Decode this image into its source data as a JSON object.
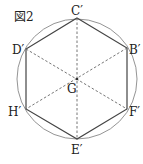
{
  "figure": {
    "title": "図2",
    "center_label": "G",
    "vertices": [
      {
        "id": "C",
        "label": "C′"
      },
      {
        "id": "B",
        "label": "B′"
      },
      {
        "id": "F",
        "label": "F′"
      },
      {
        "id": "E",
        "label": "E′"
      },
      {
        "id": "H",
        "label": "H′"
      },
      {
        "id": "D",
        "label": "D′"
      }
    ],
    "shape": "regular hexagon inscribed in circle",
    "diagonals": [
      [
        "C",
        "E"
      ],
      [
        "D",
        "F"
      ],
      [
        "B",
        "H"
      ]
    ],
    "colors": {
      "stroke": "#444444",
      "circle": "#888888",
      "dashed": "#666666"
    }
  }
}
